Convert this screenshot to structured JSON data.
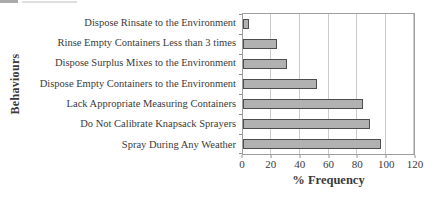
{
  "chart_data": {
    "type": "bar",
    "orientation": "horizontal",
    "title": "",
    "categories": [
      "Dispose Rinsate to the Environment",
      "Rinse Empty Containers Less than 3 times",
      "Dispose Surplus Mixes to the Environment",
      "Dispose Empty Containers to the Environment",
      "Lack Appropriate Measuring Containers",
      "Do Not Calibrate Knapsack Sprayers",
      "Spray During Any Weather"
    ],
    "values": [
      4,
      24,
      31,
      52,
      84,
      89,
      97
    ],
    "xlabel": "% Frequency",
    "ylabel": "Behaviours",
    "xlim": [
      0,
      120
    ],
    "xticks": [
      0,
      20,
      40,
      60,
      80,
      100,
      120
    ],
    "grid": true,
    "legend": "none",
    "bar_fill_color": "#b1b1b1",
    "bar_border_color": "#4d4d4d"
  }
}
